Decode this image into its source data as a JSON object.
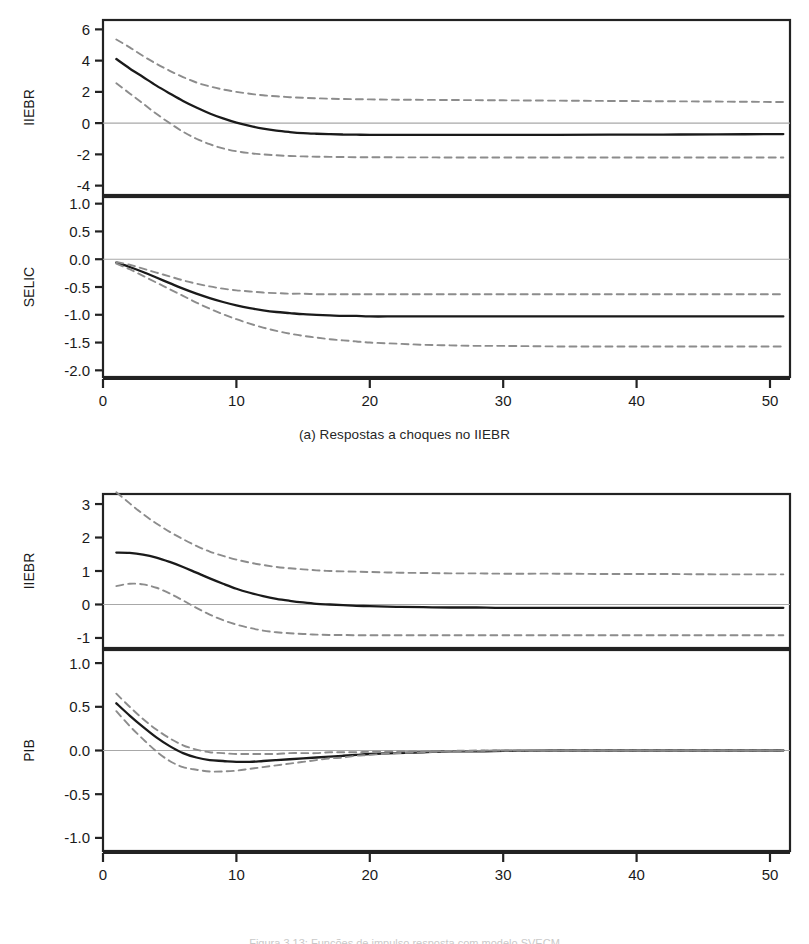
{
  "figures": [
    {
      "id": "a",
      "caption": "(a) Respostas a choques no IIEBR",
      "panels": [
        {
          "ylabel": "IIEBR",
          "yticks": [
            "6",
            "4",
            "2",
            "0",
            "-2",
            "-4"
          ],
          "ytick_values": [
            6,
            4,
            2,
            0,
            -2,
            -4
          ],
          "ylim": [
            -4.6,
            6.6
          ]
        },
        {
          "ylabel": "SELIC",
          "yticks": [
            "1.0",
            "0.5",
            "0.0",
            "-0.5",
            "-1.0",
            "-1.5",
            "-2.0"
          ],
          "ytick_values": [
            1.0,
            0.5,
            0.0,
            -0.5,
            -1.0,
            -1.5,
            -2.0
          ],
          "ylim": [
            -2.12,
            1.12
          ]
        }
      ],
      "xticks": [
        "0",
        "10",
        "20",
        "30",
        "40",
        "50"
      ],
      "xtick_values": [
        0,
        10,
        20,
        30,
        40,
        50
      ],
      "xlim": [
        0,
        51.5
      ]
    },
    {
      "id": "b",
      "caption": "(b) Respostas a choques na SELIC",
      "panels": [
        {
          "ylabel": "IIEBR",
          "yticks": [
            "3",
            "2",
            "1",
            "0",
            "-1"
          ],
          "ytick_values": [
            3,
            2,
            1,
            0,
            -1
          ],
          "ylim": [
            -1.3,
            3.3
          ]
        },
        {
          "ylabel": "PIB",
          "yticks": [
            "1.0",
            "0.5",
            "0.0",
            "-0.5",
            "-1.0"
          ],
          "ytick_values": [
            1.0,
            0.5,
            0.0,
            -0.5,
            -1.0
          ],
          "ylim": [
            -1.15,
            1.15
          ]
        }
      ],
      "xticks": [
        "0",
        "10",
        "20",
        "30",
        "40",
        "50"
      ],
      "xtick_values": [
        0,
        10,
        20,
        30,
        40,
        50
      ],
      "xlim": [
        0,
        51.5
      ]
    }
  ],
  "footer_note": "Figura 3.13: Funções de impulso resposta com modelo SVECM",
  "colors": {
    "line": "#1a1a1a",
    "band": "#8c8c8c",
    "zero": "#a8a8a8",
    "frame": "#222222"
  },
  "chart_data": [
    {
      "type": "line",
      "title": "(a) Respostas a choques no IIEBR",
      "panel": "IIEBR",
      "xlabel": "",
      "ylabel": "IIEBR",
      "xlim": [
        0,
        51.5
      ],
      "ylim": [
        -4.6,
        6.6
      ],
      "grid": false,
      "legend": "none",
      "x": [
        1,
        2,
        3,
        4,
        5,
        6,
        7,
        8,
        9,
        10,
        11,
        12,
        13,
        14,
        15,
        16,
        17,
        18,
        19,
        20,
        22,
        24,
        26,
        28,
        30,
        34,
        38,
        42,
        46,
        51
      ],
      "series": [
        {
          "name": "response",
          "style": "solid",
          "values": [
            4.1,
            3.5,
            2.95,
            2.4,
            1.9,
            1.42,
            1.0,
            0.62,
            0.3,
            0.03,
            -0.18,
            -0.35,
            -0.48,
            -0.57,
            -0.64,
            -0.68,
            -0.71,
            -0.73,
            -0.74,
            -0.75,
            -0.75,
            -0.75,
            -0.75,
            -0.75,
            -0.75,
            -0.75,
            -0.74,
            -0.73,
            -0.72,
            -0.7
          ]
        },
        {
          "name": "upper-ci",
          "style": "dashed",
          "values": [
            5.35,
            4.85,
            4.3,
            3.8,
            3.35,
            2.95,
            2.6,
            2.35,
            2.15,
            2.0,
            1.88,
            1.78,
            1.72,
            1.66,
            1.62,
            1.59,
            1.56,
            1.54,
            1.53,
            1.52,
            1.5,
            1.49,
            1.48,
            1.47,
            1.46,
            1.44,
            1.42,
            1.4,
            1.38,
            1.35
          ]
        },
        {
          "name": "lower-ci",
          "style": "dashed",
          "values": [
            2.55,
            1.9,
            1.25,
            0.6,
            0.0,
            -0.55,
            -1.0,
            -1.35,
            -1.62,
            -1.8,
            -1.92,
            -2.0,
            -2.06,
            -2.1,
            -2.13,
            -2.15,
            -2.16,
            -2.17,
            -2.18,
            -2.18,
            -2.19,
            -2.19,
            -2.2,
            -2.2,
            -2.2,
            -2.2,
            -2.2,
            -2.2,
            -2.2,
            -2.2
          ]
        }
      ]
    },
    {
      "type": "line",
      "title": "(a) Respostas a choques no IIEBR",
      "panel": "SELIC",
      "xlabel": "",
      "ylabel": "SELIC",
      "xlim": [
        0,
        51.5
      ],
      "ylim": [
        -2.12,
        1.12
      ],
      "grid": false,
      "legend": "none",
      "x": [
        1,
        2,
        3,
        4,
        5,
        6,
        7,
        8,
        9,
        10,
        11,
        12,
        13,
        14,
        15,
        16,
        17,
        18,
        19,
        20,
        22,
        24,
        26,
        28,
        30,
        34,
        38,
        42,
        46,
        51
      ],
      "series": [
        {
          "name": "response",
          "style": "solid",
          "values": [
            -0.06,
            -0.14,
            -0.23,
            -0.33,
            -0.43,
            -0.53,
            -0.62,
            -0.7,
            -0.77,
            -0.83,
            -0.88,
            -0.92,
            -0.95,
            -0.97,
            -0.99,
            -1.0,
            -1.01,
            -1.02,
            -1.02,
            -1.03,
            -1.03,
            -1.03,
            -1.03,
            -1.03,
            -1.03,
            -1.03,
            -1.03,
            -1.03,
            -1.03,
            -1.03
          ]
        },
        {
          "name": "upper-ci",
          "style": "dashed",
          "values": [
            -0.05,
            -0.1,
            -0.17,
            -0.24,
            -0.31,
            -0.38,
            -0.44,
            -0.49,
            -0.53,
            -0.56,
            -0.58,
            -0.6,
            -0.61,
            -0.62,
            -0.62,
            -0.63,
            -0.63,
            -0.63,
            -0.63,
            -0.63,
            -0.63,
            -0.63,
            -0.63,
            -0.63,
            -0.63,
            -0.63,
            -0.63,
            -0.63,
            -0.63,
            -0.63
          ]
        },
        {
          "name": "lower-ci",
          "style": "dashed",
          "values": [
            -0.08,
            -0.18,
            -0.3,
            -0.42,
            -0.54,
            -0.66,
            -0.78,
            -0.89,
            -0.99,
            -1.08,
            -1.16,
            -1.23,
            -1.29,
            -1.34,
            -1.38,
            -1.41,
            -1.44,
            -1.46,
            -1.48,
            -1.5,
            -1.52,
            -1.54,
            -1.55,
            -1.56,
            -1.56,
            -1.57,
            -1.57,
            -1.57,
            -1.57,
            -1.57
          ]
        }
      ]
    },
    {
      "type": "line",
      "title": "(b) Respostas a choques na SELIC",
      "panel": "IIEBR",
      "xlabel": "",
      "ylabel": "IIEBR",
      "xlim": [
        0,
        51.5
      ],
      "ylim": [
        -1.3,
        3.3
      ],
      "grid": false,
      "legend": "none",
      "x": [
        1,
        2,
        3,
        4,
        5,
        6,
        7,
        8,
        9,
        10,
        11,
        12,
        13,
        14,
        15,
        16,
        17,
        18,
        19,
        20,
        22,
        24,
        26,
        28,
        30,
        34,
        38,
        42,
        46,
        51
      ],
      "series": [
        {
          "name": "response",
          "style": "solid",
          "values": [
            1.55,
            1.54,
            1.49,
            1.4,
            1.27,
            1.12,
            0.95,
            0.78,
            0.62,
            0.47,
            0.35,
            0.25,
            0.17,
            0.11,
            0.06,
            0.02,
            0.0,
            -0.02,
            -0.04,
            -0.05,
            -0.07,
            -0.08,
            -0.09,
            -0.09,
            -0.1,
            -0.1,
            -0.1,
            -0.1,
            -0.1,
            -0.1
          ]
        },
        {
          "name": "upper-ci",
          "style": "dashed",
          "values": [
            3.35,
            3.02,
            2.7,
            2.42,
            2.17,
            1.95,
            1.75,
            1.58,
            1.45,
            1.34,
            1.25,
            1.18,
            1.12,
            1.08,
            1.05,
            1.02,
            1.0,
            0.99,
            0.98,
            0.97,
            0.95,
            0.94,
            0.93,
            0.93,
            0.92,
            0.92,
            0.91,
            0.91,
            0.9,
            0.9
          ]
        },
        {
          "name": "lower-ci",
          "style": "dashed",
          "values": [
            0.55,
            0.62,
            0.6,
            0.5,
            0.33,
            0.12,
            -0.1,
            -0.3,
            -0.47,
            -0.6,
            -0.7,
            -0.78,
            -0.83,
            -0.86,
            -0.88,
            -0.9,
            -0.91,
            -0.91,
            -0.92,
            -0.92,
            -0.92,
            -0.92,
            -0.92,
            -0.92,
            -0.92,
            -0.92,
            -0.92,
            -0.92,
            -0.92,
            -0.92
          ]
        }
      ]
    },
    {
      "type": "line",
      "title": "(b) Respostas a choques na SELIC",
      "panel": "PIB",
      "xlabel": "",
      "ylabel": "PIB",
      "xlim": [
        0,
        51.5
      ],
      "ylim": [
        -1.15,
        1.15
      ],
      "grid": false,
      "legend": "none",
      "x": [
        1,
        2,
        3,
        4,
        5,
        6,
        7,
        8,
        9,
        10,
        11,
        12,
        13,
        14,
        15,
        16,
        17,
        18,
        19,
        20,
        22,
        24,
        26,
        28,
        30,
        34,
        38,
        42,
        46,
        51
      ],
      "series": [
        {
          "name": "response",
          "style": "solid",
          "values": [
            0.54,
            0.4,
            0.27,
            0.15,
            0.05,
            -0.03,
            -0.08,
            -0.11,
            -0.12,
            -0.13,
            -0.13,
            -0.12,
            -0.11,
            -0.1,
            -0.09,
            -0.08,
            -0.07,
            -0.06,
            -0.05,
            -0.04,
            -0.03,
            -0.02,
            -0.01,
            -0.01,
            -0.005,
            0.0,
            0.0,
            0.0,
            0.0,
            0.0
          ]
        },
        {
          "name": "upper-ci",
          "style": "dashed",
          "values": [
            0.65,
            0.5,
            0.36,
            0.24,
            0.14,
            0.06,
            0.01,
            -0.02,
            -0.03,
            -0.04,
            -0.04,
            -0.04,
            -0.04,
            -0.03,
            -0.03,
            -0.03,
            -0.02,
            -0.02,
            -0.02,
            -0.015,
            -0.01,
            -0.01,
            -0.005,
            0.0,
            0.0,
            0.0,
            0.0,
            0.0,
            0.0,
            0.0
          ]
        },
        {
          "name": "lower-ci",
          "style": "dashed",
          "values": [
            0.45,
            0.28,
            0.13,
            -0.01,
            -0.12,
            -0.19,
            -0.22,
            -0.24,
            -0.24,
            -0.23,
            -0.21,
            -0.19,
            -0.17,
            -0.15,
            -0.13,
            -0.11,
            -0.09,
            -0.08,
            -0.06,
            -0.05,
            -0.03,
            -0.02,
            -0.01,
            -0.005,
            0.0,
            0.0,
            0.0,
            0.0,
            0.0,
            0.0
          ]
        }
      ]
    }
  ]
}
